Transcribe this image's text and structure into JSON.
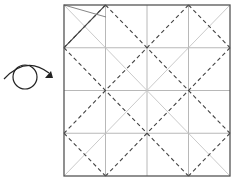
{
  "diagram": {
    "type": "origami-crease-pattern",
    "grid_divisions": 4,
    "symbols": [
      {
        "name": "turn-over",
        "description": "turn the paper over"
      }
    ],
    "line_styles": {
      "border": "#555555",
      "grid_crease": "#b0b0b0",
      "diagonal_crease": "#c0c0c0",
      "valley_fold": "#444444",
      "arrow": "#222222"
    }
  }
}
